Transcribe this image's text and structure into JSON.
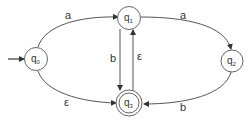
{
  "diagram": {
    "type": "finite-automaton",
    "start_state": "q0",
    "accept_states": [
      "q3"
    ],
    "states": [
      {
        "id": "q0",
        "label": "q",
        "sub": "0"
      },
      {
        "id": "q1",
        "label": "q",
        "sub": "1"
      },
      {
        "id": "q2",
        "label": "q",
        "sub": "2"
      },
      {
        "id": "q3",
        "label": "q",
        "sub": "3"
      }
    ],
    "transitions": [
      {
        "from": "q0",
        "to": "q1",
        "label": "a"
      },
      {
        "from": "q0",
        "to": "q3",
        "label": "ε"
      },
      {
        "from": "q1",
        "to": "q2",
        "label": "a"
      },
      {
        "from": "q1",
        "to": "q3",
        "label": "b"
      },
      {
        "from": "q3",
        "to": "q1",
        "label": "ε"
      },
      {
        "from": "q2",
        "to": "q3",
        "label": "b"
      }
    ],
    "colors": {
      "stroke": "#555555",
      "text": "#333333",
      "background": "#ffffff"
    }
  }
}
